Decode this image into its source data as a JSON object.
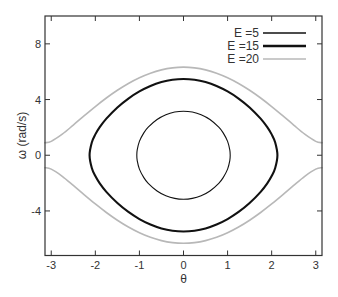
{
  "figure": {
    "background": "#ffffff",
    "axes_color": "#333333"
  },
  "chart_data": {
    "type": "line",
    "title": "",
    "xlabel": "θ",
    "ylabel": "ω (rad/s)",
    "xlim": [
      -3.1416,
      3.1416
    ],
    "ylim": [
      -7.2,
      10
    ],
    "xticks": [
      -3,
      -2,
      -1,
      0,
      1,
      2,
      3
    ],
    "xtick_labels": [
      "-3",
      "-2",
      "-1",
      "0",
      "1",
      "2",
      "3"
    ],
    "yticks": [
      -4,
      0,
      4,
      8
    ],
    "ytick_labels": [
      "-4",
      "0",
      "4",
      "8"
    ],
    "ticks_on_all_sides": true,
    "grid": false,
    "legend": {
      "position": "upper right"
    },
    "series": [
      {
        "name": "E =5",
        "color": "#111111",
        "line_width": 1.1,
        "closed": true,
        "theta": [
          -1.0591,
          -1.05,
          -1.0,
          -0.9,
          -0.8,
          -0.6,
          -0.4,
          -0.2,
          0,
          0.2,
          0.4,
          0.6,
          0.8,
          0.9,
          1.0,
          1.05,
          1.0591
        ],
        "omega_upper": [
          0,
          0.39,
          0.995,
          1.607,
          2.014,
          2.564,
          2.907,
          3.1,
          3.162,
          3.1,
          2.907,
          2.564,
          2.014,
          1.607,
          0.995,
          0.39,
          0
        ],
        "omega_lower": [
          0,
          -0.39,
          -0.995,
          -1.607,
          -2.014,
          -2.564,
          -2.907,
          -3.1,
          -3.162,
          -3.1,
          -2.907,
          -2.564,
          -2.014,
          -1.607,
          -0.995,
          -0.39,
          0
        ]
      },
      {
        "name": "E =15",
        "color": "#111111",
        "line_width": 2.1,
        "closed": true,
        "theta": [
          -2.1303,
          -2.08,
          -2.0,
          -1.9,
          -1.75,
          -1.5,
          -1.25,
          -1.0,
          -0.75,
          -0.5,
          -0.25,
          0,
          0.25,
          0.5,
          0.75,
          1.0,
          1.25,
          1.5,
          1.75,
          1.9,
          2.0,
          2.08,
          2.1303
        ],
        "omega_upper": [
          0,
          0.914,
          1.498,
          2.016,
          2.628,
          3.433,
          4.072,
          4.582,
          4.974,
          5.254,
          5.421,
          5.477,
          5.421,
          5.254,
          4.974,
          4.582,
          4.072,
          3.433,
          2.628,
          2.016,
          1.498,
          0.914,
          0
        ],
        "omega_lower": [
          0,
          -0.914,
          -1.498,
          -2.016,
          -2.628,
          -3.433,
          -4.072,
          -4.582,
          -4.974,
          -5.254,
          -5.421,
          -5.477,
          -5.421,
          -5.254,
          -4.974,
          -4.582,
          -4.072,
          -3.433,
          -2.628,
          -2.016,
          -1.498,
          -0.914,
          0
        ]
      },
      {
        "name": "E =20",
        "color": "#b8b8b8",
        "line_width": 1.6,
        "closed": false,
        "theta": [
          -3.1416,
          -3.0,
          -2.75,
          -2.5,
          -2.25,
          -2.0,
          -1.75,
          -1.5,
          -1.25,
          -1.0,
          -0.75,
          -0.5,
          -0.25,
          0,
          0.25,
          0.5,
          0.75,
          1.0,
          1.25,
          1.5,
          1.75,
          2.0,
          2.25,
          2.5,
          2.75,
          3.0,
          3.1416
        ],
        "omega_upper": [
          0.894,
          0.998,
          1.511,
          2.167,
          2.844,
          3.499,
          4.112,
          4.668,
          5.156,
          5.567,
          5.894,
          6.132,
          6.276,
          6.325,
          6.276,
          6.132,
          5.894,
          5.567,
          5.156,
          4.668,
          4.112,
          3.499,
          2.844,
          2.167,
          1.511,
          0.998,
          0.894
        ],
        "omega_lower": [
          -0.894,
          -0.998,
          -1.511,
          -2.167,
          -2.844,
          -3.499,
          -4.112,
          -4.668,
          -5.156,
          -5.567,
          -5.894,
          -6.132,
          -6.276,
          -6.325,
          -6.276,
          -6.132,
          -5.894,
          -5.567,
          -5.156,
          -4.668,
          -4.112,
          -3.499,
          -2.844,
          -2.167,
          -1.511,
          -0.998,
          -0.894
        ]
      }
    ]
  }
}
